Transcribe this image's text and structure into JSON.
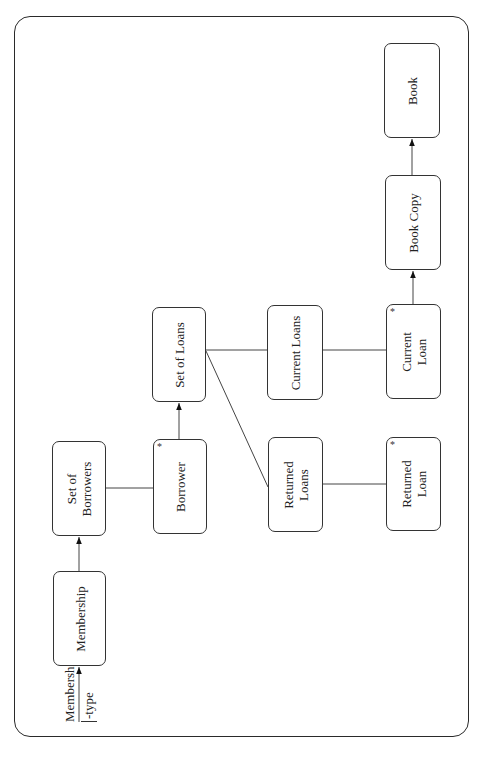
{
  "diagram": {
    "type": "tree structure diagram (rotated 90°)",
    "external_input": {
      "line1": "Membership",
      "line2": "-type"
    },
    "nodes": [
      {
        "id": "membership",
        "label": "Membership",
        "multiple": false
      },
      {
        "id": "set-of-borrowers",
        "label": "Set of\nBorrowers",
        "multiple": false
      },
      {
        "id": "borrower",
        "label": "Borrower",
        "multiple": true
      },
      {
        "id": "set-of-loans",
        "label": "Set of Loans",
        "multiple": false
      },
      {
        "id": "current-loans",
        "label": "Current Loans",
        "multiple": false
      },
      {
        "id": "returned-loans",
        "label": "Returned\nLoans",
        "multiple": false
      },
      {
        "id": "current-loan",
        "label": "Current\nLoan",
        "multiple": true
      },
      {
        "id": "returned-loan",
        "label": "Returned\nLoan",
        "multiple": true
      },
      {
        "id": "book-copy",
        "label": "Book Copy",
        "multiple": false
      },
      {
        "id": "book",
        "label": "Book",
        "multiple": false
      }
    ],
    "star_symbol": "*",
    "edges": [
      {
        "from": "membership-type",
        "to": "membership",
        "arrow": true
      },
      {
        "from": "membership",
        "to": "set-of-borrowers",
        "arrow": true
      },
      {
        "from": "set-of-borrowers",
        "to": "borrower",
        "arrow": false
      },
      {
        "from": "borrower",
        "to": "set-of-loans",
        "arrow": true
      },
      {
        "from": "set-of-loans",
        "to": "current-loans",
        "arrow": false
      },
      {
        "from": "set-of-loans",
        "to": "returned-loans",
        "arrow": false
      },
      {
        "from": "current-loans",
        "to": "current-loan",
        "arrow": false
      },
      {
        "from": "returned-loans",
        "to": "returned-loan",
        "arrow": false
      },
      {
        "from": "current-loan",
        "to": "book-copy",
        "arrow": true
      },
      {
        "from": "book-copy",
        "to": "book",
        "arrow": true
      }
    ]
  }
}
